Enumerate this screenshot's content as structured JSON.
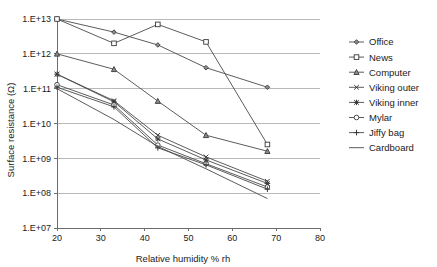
{
  "chart_data": {
    "type": "line",
    "title": "",
    "xlabel": "Relative humidity % rh",
    "ylabel": "Surface resistance (Ω)",
    "xlim": [
      20,
      80
    ],
    "ylim": [
      10000000.0,
      10000000000000.0
    ],
    "yscale": "log",
    "xticks": [
      20,
      30,
      40,
      50,
      60,
      70,
      80
    ],
    "xticklabels": [
      "20",
      "30",
      "40",
      "50",
      "60",
      "70",
      "80"
    ],
    "yticks": [
      10000000.0,
      100000000.0,
      1000000000.0,
      10000000000.0,
      100000000000.0,
      1000000000000.0,
      10000000000000.0
    ],
    "yticklabels": [
      "1.E+07",
      "1.E+08",
      "1.E+09",
      "1.E+10",
      "1.E+11",
      "1.E+12",
      "1.E+13"
    ],
    "grid": "horizontal",
    "legend_position": "right",
    "x": [
      20,
      33,
      43,
      54,
      68
    ],
    "series": [
      {
        "name": "Office",
        "marker": "diamond",
        "values": [
          10000000000000.0,
          4200000000000.0,
          1800000000000.0,
          400000000000.0,
          110000000000.0
        ]
      },
      {
        "name": "News",
        "marker": "square",
        "values": [
          10000000000000.0,
          2000000000000.0,
          7000000000000.0,
          2200000000000.0,
          2500000000.0
        ]
      },
      {
        "name": "Computer",
        "marker": "triangle",
        "values": [
          1000000000000.0,
          360000000000.0,
          44000000000.0,
          4600000000.0,
          1600000000.0
        ]
      },
      {
        "name": "Viking outer",
        "marker": "cross",
        "values": [
          260000000000.0,
          45000000000.0,
          4600000000.0,
          1100000000.0,
          220000000.0
        ]
      },
      {
        "name": "Viking inner",
        "marker": "asterisk",
        "values": [
          260000000000.0,
          42000000000.0,
          3600000000.0,
          900000000.0,
          190000000.0
        ]
      },
      {
        "name": "Mylar",
        "marker": "circle",
        "values": [
          130000000000.0,
          34000000000.0,
          2400000000.0,
          700000000.0,
          150000000.0
        ]
      },
      {
        "name": "Jiffy bag",
        "marker": "plus",
        "values": [
          110000000000.0,
          30000000000.0,
          2000000000.0,
          650000000.0,
          130000000.0
        ]
      },
      {
        "name": "Cardboard",
        "marker": "none",
        "values": [
          100000000000.0,
          13000000000.0,
          2200000000.0,
          500000000.0,
          70000000.0
        ]
      }
    ],
    "legend_entries": [
      {
        "label": "Office",
        "marker": "diamond"
      },
      {
        "label": "News",
        "marker": "square"
      },
      {
        "label": "Computer",
        "marker": "triangle"
      },
      {
        "label": "Viking outer",
        "marker": "cross"
      },
      {
        "label": "Viking inner",
        "marker": "asterisk"
      },
      {
        "label": "Mylar",
        "marker": "circle"
      },
      {
        "label": "Jiffy bag",
        "marker": "plus"
      },
      {
        "label": "Cardboard",
        "marker": "none"
      }
    ],
    "colors": {
      "line": "#4a4a4a",
      "grid": "#b9b9b9",
      "axis": "#6d6d6d",
      "text": "#1a1a1a",
      "background": "#ffffff"
    }
  }
}
